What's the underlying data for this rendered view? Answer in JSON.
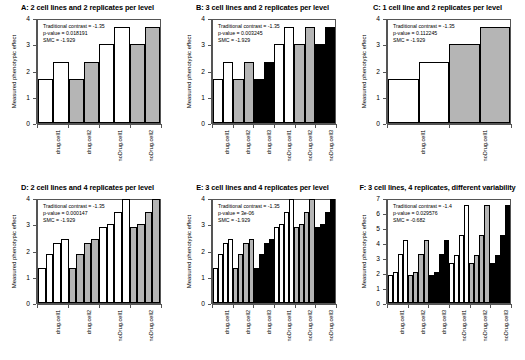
{
  "figure": {
    "ylabel": "Measured phenotypic effect",
    "stat_labels": {
      "contrast": "Traditional contrast = ",
      "pvalue": "p-value = ",
      "smc": "SMC = "
    }
  },
  "chart_data": [
    {
      "id": "A",
      "type": "bar",
      "title": "A: 2 cell lines and 2 replicates per level",
      "ylabel": "Measured phenotypic effect",
      "xlabel": "",
      "ylim": [
        0,
        4
      ],
      "yticks": [
        0,
        1,
        2,
        3,
        4
      ],
      "grid": false,
      "annotations": {
        "contrast": "Traditional contrast =  -1.35",
        "pvalue": "p-value = 0.018191",
        "smc": "SMC =  -1.929"
      },
      "groups": [
        "drug.cell1",
        "drug.cell2",
        "noDrug.cell1",
        "noDrug.cell2"
      ],
      "categories": [
        "drug.cell1",
        "drug.cell1",
        "drug.cell2",
        "drug.cell2",
        "noDrug.cell1",
        "noDrug.cell1",
        "noDrug.cell2",
        "noDrug.cell2"
      ],
      "values": [
        1.67,
        2.33,
        1.67,
        2.33,
        3.0,
        3.67,
        3.0,
        3.67
      ],
      "fills": [
        "#ffffff",
        "#ffffff",
        "#b5b5b5",
        "#b5b5b5",
        "#ffffff",
        "#ffffff",
        "#b5b5b5",
        "#b5b5b5"
      ]
    },
    {
      "id": "B",
      "type": "bar",
      "title": "B: 3 cell lines and 2 replicates per level",
      "ylabel": "Measured phenotypic effect",
      "xlabel": "",
      "ylim": [
        0,
        4
      ],
      "yticks": [
        0,
        1,
        2,
        3,
        4
      ],
      "grid": false,
      "annotations": {
        "contrast": "Traditional contrast =  -1.35",
        "pvalue": "p-value = 0.003245",
        "smc": "SMC =  -1.929"
      },
      "groups": [
        "drug.cell1",
        "drug.cell2",
        "drug.cell3",
        "noDrug.cell1",
        "noDrug.cell2",
        "noDrug.cell3"
      ],
      "categories": [
        "drug.cell1",
        "drug.cell1",
        "drug.cell2",
        "drug.cell2",
        "drug.cell3",
        "drug.cell3",
        "noDrug.cell1",
        "noDrug.cell1",
        "noDrug.cell2",
        "noDrug.cell2",
        "noDrug.cell3",
        "noDrug.cell3"
      ],
      "values": [
        1.67,
        2.33,
        1.67,
        2.33,
        1.67,
        2.33,
        3.0,
        3.67,
        3.0,
        3.67,
        3.0,
        3.67
      ],
      "fills": [
        "#ffffff",
        "#ffffff",
        "#b5b5b5",
        "#b5b5b5",
        "#000000",
        "#000000",
        "#ffffff",
        "#ffffff",
        "#b5b5b5",
        "#b5b5b5",
        "#000000",
        "#000000"
      ]
    },
    {
      "id": "C",
      "type": "bar",
      "title": "C: 1 cell line and 2 replicates per level",
      "ylabel": "Measured phenotypic effect",
      "xlabel": "",
      "ylim": [
        0,
        4
      ],
      "yticks": [
        0,
        1,
        2,
        3,
        4
      ],
      "grid": false,
      "annotations": {
        "contrast": "Traditional contrast =  -1.35",
        "pvalue": "p-value = 0.112245",
        "smc": "SMC =  -1.929"
      },
      "groups": [
        "drug.cell1",
        "noDrug.cell1"
      ],
      "categories": [
        "drug.cell1",
        "drug.cell1",
        "noDrug.cell1",
        "noDrug.cell1"
      ],
      "values": [
        1.67,
        2.33,
        3.0,
        3.67
      ],
      "fills": [
        "#ffffff",
        "#ffffff",
        "#b5b5b5",
        "#b5b5b5"
      ]
    },
    {
      "id": "D",
      "type": "bar",
      "title": "D: 2 cell lines and 4 replicates per level",
      "ylabel": "Measured phenotypic effect",
      "xlabel": "",
      "ylim": [
        0,
        4
      ],
      "yticks": [
        0,
        1,
        2,
        3,
        4
      ],
      "grid": false,
      "annotations": {
        "contrast": "Traditional contrast =  -1.35",
        "pvalue": "p-value = 0.000147",
        "smc": "SMC =  -1.929"
      },
      "groups": [
        "drug.cell1",
        "drug.cell2",
        "noDrug.cell1",
        "noDrug.cell2"
      ],
      "categories": [
        "drug.cell1",
        "drug.cell1",
        "drug.cell1",
        "drug.cell1",
        "drug.cell2",
        "drug.cell2",
        "drug.cell2",
        "drug.cell2",
        "noDrug.cell1",
        "noDrug.cell1",
        "noDrug.cell1",
        "noDrug.cell1",
        "noDrug.cell2",
        "noDrug.cell2",
        "noDrug.cell2",
        "noDrug.cell2"
      ],
      "values": [
        1.35,
        1.85,
        2.3,
        2.42,
        1.35,
        1.85,
        2.3,
        2.42,
        2.88,
        3.0,
        3.48,
        3.95,
        2.88,
        3.0,
        3.48,
        3.95
      ],
      "fills": [
        "#ffffff",
        "#ffffff",
        "#ffffff",
        "#ffffff",
        "#b5b5b5",
        "#b5b5b5",
        "#b5b5b5",
        "#b5b5b5",
        "#ffffff",
        "#ffffff",
        "#ffffff",
        "#ffffff",
        "#b5b5b5",
        "#b5b5b5",
        "#b5b5b5",
        "#b5b5b5"
      ]
    },
    {
      "id": "E",
      "type": "bar",
      "title": "E: 3 cell lines and 4 replicates per level",
      "ylabel": "Measured phenotypic effect",
      "xlabel": "",
      "ylim": [
        0,
        4
      ],
      "yticks": [
        0,
        1,
        2,
        3,
        4
      ],
      "grid": false,
      "annotations": {
        "contrast": "Traditional contrast =  -1.35",
        "pvalue": "p-value = 3e-06",
        "smc": "SMC =  -1.929"
      },
      "groups": [
        "drug.cell1",
        "drug.cell2",
        "drug.cell3",
        "noDrug.cell1",
        "noDrug.cell2",
        "noDrug.cell3"
      ],
      "categories": [
        "drug.cell1",
        "drug.cell1",
        "drug.cell1",
        "drug.cell1",
        "drug.cell2",
        "drug.cell2",
        "drug.cell2",
        "drug.cell2",
        "drug.cell3",
        "drug.cell3",
        "drug.cell3",
        "drug.cell3",
        "noDrug.cell1",
        "noDrug.cell1",
        "noDrug.cell1",
        "noDrug.cell1",
        "noDrug.cell2",
        "noDrug.cell2",
        "noDrug.cell2",
        "noDrug.cell2",
        "noDrug.cell3",
        "noDrug.cell3",
        "noDrug.cell3",
        "noDrug.cell3"
      ],
      "values": [
        1.35,
        1.85,
        2.3,
        2.42,
        1.35,
        1.85,
        2.3,
        2.42,
        1.35,
        1.85,
        2.3,
        2.42,
        2.88,
        3.0,
        3.48,
        3.95,
        2.88,
        3.0,
        3.48,
        3.95,
        2.88,
        3.0,
        3.48,
        3.95
      ],
      "fills": [
        "#ffffff",
        "#ffffff",
        "#ffffff",
        "#ffffff",
        "#b5b5b5",
        "#b5b5b5",
        "#b5b5b5",
        "#b5b5b5",
        "#000000",
        "#000000",
        "#000000",
        "#000000",
        "#ffffff",
        "#ffffff",
        "#ffffff",
        "#ffffff",
        "#b5b5b5",
        "#b5b5b5",
        "#b5b5b5",
        "#b5b5b5",
        "#000000",
        "#000000",
        "#000000",
        "#000000"
      ]
    },
    {
      "id": "F",
      "type": "bar",
      "title": "F: 3 cell lines, 4 replicates, different variability",
      "ylabel": "Measured phenotypic effect",
      "xlabel": "",
      "ylim": [
        0,
        7
      ],
      "yticks": [
        0,
        1,
        2,
        3,
        4,
        5,
        6,
        7
      ],
      "grid": false,
      "annotations": {
        "contrast": "Traditional contrast =  -1.4",
        "pvalue": "p-value = 0.029576",
        "smc": "SMC =  -0.682"
      },
      "groups": [
        "drug.cell1",
        "drug.cell2",
        "drug.cell3",
        "noDrug.cell1",
        "noDrug.cell2",
        "noDrug.cell3"
      ],
      "categories": [
        "drug.cell1",
        "drug.cell1",
        "drug.cell1",
        "drug.cell1",
        "drug.cell2",
        "drug.cell2",
        "drug.cell2",
        "drug.cell2",
        "drug.cell3",
        "drug.cell3",
        "drug.cell3",
        "drug.cell3",
        "noDrug.cell1",
        "noDrug.cell1",
        "noDrug.cell1",
        "noDrug.cell1",
        "noDrug.cell2",
        "noDrug.cell2",
        "noDrug.cell2",
        "noDrug.cell2",
        "noDrug.cell3",
        "noDrug.cell3",
        "noDrug.cell3",
        "noDrug.cell3"
      ],
      "values": [
        1.9,
        2.1,
        3.3,
        4.2,
        1.9,
        2.1,
        3.3,
        4.2,
        1.9,
        2.1,
        3.3,
        4.2,
        2.65,
        3.2,
        4.55,
        6.55,
        2.65,
        3.2,
        4.55,
        6.55,
        2.65,
        3.2,
        4.55,
        6.55
      ],
      "fills": [
        "#ffffff",
        "#ffffff",
        "#ffffff",
        "#ffffff",
        "#b5b5b5",
        "#b5b5b5",
        "#b5b5b5",
        "#b5b5b5",
        "#000000",
        "#000000",
        "#000000",
        "#000000",
        "#ffffff",
        "#ffffff",
        "#ffffff",
        "#ffffff",
        "#b5b5b5",
        "#b5b5b5",
        "#b5b5b5",
        "#b5b5b5",
        "#000000",
        "#000000",
        "#000000",
        "#000000"
      ]
    }
  ]
}
